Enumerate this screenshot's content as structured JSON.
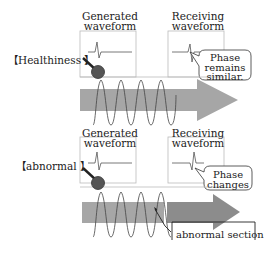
{
  "diagram": {
    "panels": [
      {
        "id": "healthiness",
        "side_label": "【Healthiness 】",
        "generated_label_line1": "Generated",
        "generated_label_line2": "waveform",
        "receiving_label_line1": "Receiving",
        "receiving_label_line2": "waveform",
        "callout_line1": "Phase",
        "callout_line2": "remains",
        "callout_line3": "similar."
      },
      {
        "id": "abnormal",
        "side_label": "【abnormal 】",
        "generated_label_line1": "Generated",
        "generated_label_line2": "waveform",
        "receiving_label_line1": "Receiving",
        "receiving_label_line2": "waveform",
        "callout_line1": "Phase",
        "callout_line2": "changes",
        "abnormal_section_label": "abnormal section"
      }
    ],
    "colors": {
      "arrow_fill": "#a6a6a6",
      "arrow_fill_dark": "#8c8c8c",
      "sensor_ball": "#555555",
      "line": "#333333",
      "box_border": "#bbbbbb"
    }
  }
}
